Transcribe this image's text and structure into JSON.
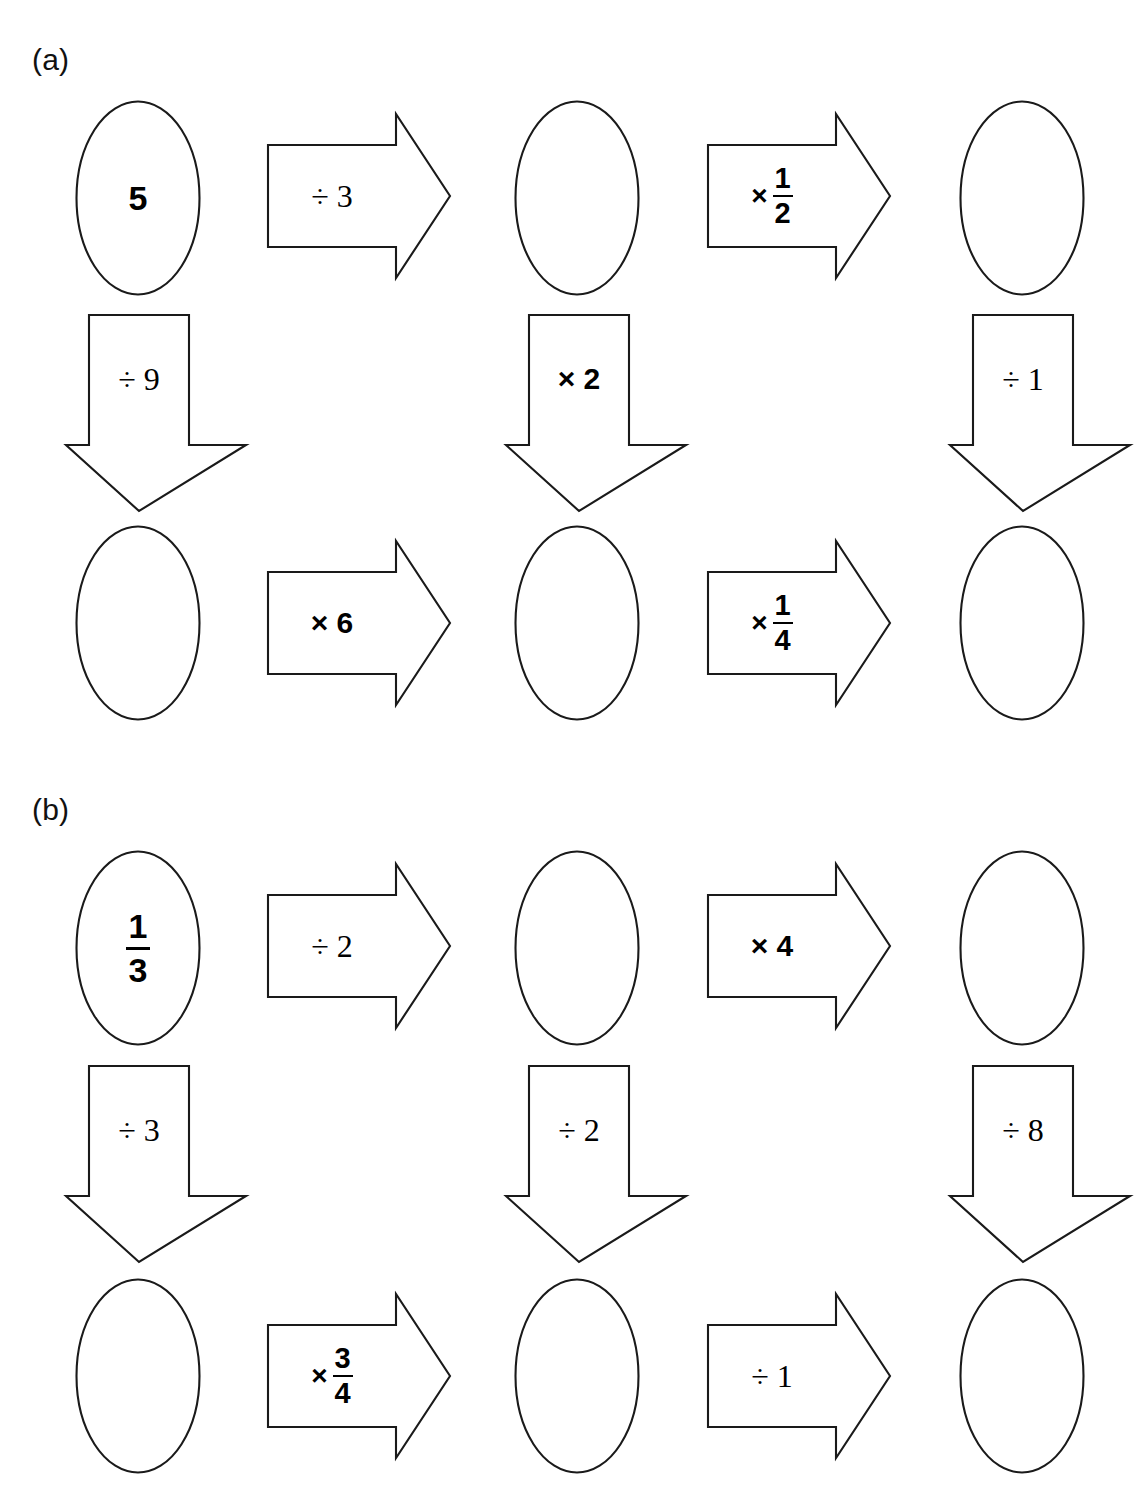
{
  "page": {
    "background": "#ffffff",
    "stroke_color": "#1a1a1a",
    "width": 1133,
    "height": 1500
  },
  "sections": [
    {
      "label": "(a)",
      "start_value": "5",
      "nodes": [
        {
          "id": "a-r1c1",
          "value": "5"
        },
        {
          "id": "a-r1c2",
          "value": ""
        },
        {
          "id": "a-r1c3",
          "value": ""
        },
        {
          "id": "a-r2c1",
          "value": ""
        },
        {
          "id": "a-r2c2",
          "value": ""
        },
        {
          "id": "a-r2c3",
          "value": ""
        }
      ],
      "right_arrows_top": [
        {
          "operator": "÷",
          "operand": "3",
          "text": "÷ 3"
        },
        {
          "operator": "×",
          "operand": "1/2",
          "text": "× 1/2",
          "numerator": "1",
          "denominator": "2"
        }
      ],
      "down_arrows": [
        {
          "operator": "÷",
          "operand": "9",
          "text": "÷ 9"
        },
        {
          "operator": "×",
          "operand": "2",
          "text": "× 2"
        },
        {
          "operator": "÷",
          "operand": "1",
          "text": "÷ 1"
        }
      ],
      "right_arrows_bottom": [
        {
          "operator": "×",
          "operand": "6",
          "text": "× 6"
        },
        {
          "operator": "×",
          "operand": "1/4",
          "text": "× 1/4",
          "numerator": "1",
          "denominator": "4"
        }
      ]
    },
    {
      "label": "(b)",
      "start_value": "1/3",
      "nodes": [
        {
          "id": "b-r1c1",
          "value": "1/3",
          "numerator": "1",
          "denominator": "3"
        },
        {
          "id": "b-r1c2",
          "value": ""
        },
        {
          "id": "b-r1c3",
          "value": ""
        },
        {
          "id": "b-r2c1",
          "value": ""
        },
        {
          "id": "b-r2c2",
          "value": ""
        },
        {
          "id": "b-r2c3",
          "value": ""
        }
      ],
      "right_arrows_top": [
        {
          "operator": "÷",
          "operand": "2",
          "text": "÷ 2"
        },
        {
          "operator": "×",
          "operand": "4",
          "text": "× 4"
        }
      ],
      "down_arrows": [
        {
          "operator": "÷",
          "operand": "3",
          "text": "÷ 3"
        },
        {
          "operator": "÷",
          "operand": "2",
          "text": "÷ 2"
        },
        {
          "operator": "÷",
          "operand": "8",
          "text": "÷ 8"
        }
      ],
      "right_arrows_bottom": [
        {
          "operator": "×",
          "operand": "3/4",
          "text": "× 3/4",
          "numerator": "3",
          "denominator": "4"
        },
        {
          "operator": "÷",
          "operand": "1",
          "text": "÷ 1"
        }
      ]
    }
  ],
  "symbols": {
    "divide": "÷",
    "multiply": "×"
  }
}
